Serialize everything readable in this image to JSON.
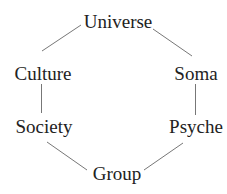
{
  "diagram": {
    "type": "hexagonal-cycle",
    "line_color": "#777777",
    "text_color": "#222222",
    "nodes": [
      {
        "id": "universe",
        "label": "Universe"
      },
      {
        "id": "soma",
        "label": "Soma"
      },
      {
        "id": "psyche",
        "label": "Psyche"
      },
      {
        "id": "group",
        "label": "Group"
      },
      {
        "id": "society",
        "label": "Society"
      },
      {
        "id": "culture",
        "label": "Culture"
      }
    ],
    "edges": [
      {
        "from": "universe",
        "to": "culture"
      },
      {
        "from": "universe",
        "to": "soma"
      },
      {
        "from": "culture",
        "to": "society"
      },
      {
        "from": "soma",
        "to": "psyche"
      },
      {
        "from": "society",
        "to": "group"
      },
      {
        "from": "psyche",
        "to": "group"
      }
    ]
  }
}
